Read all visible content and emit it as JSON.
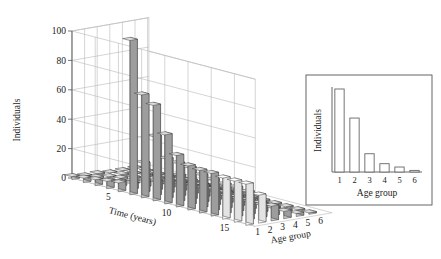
{
  "figure": {
    "main_chart": {
      "ylabel": "Individuals",
      "xlabel": "Time (years)",
      "zlabel": "Age group",
      "y_ticks": [
        "0",
        "20",
        "40",
        "60",
        "80",
        "100"
      ],
      "time_ticks": [
        "5",
        "10",
        "15"
      ],
      "age_ticks": [
        "6",
        "5",
        "4",
        "3",
        "2",
        "1"
      ]
    },
    "inset_chart": {
      "ylabel": "Individuals",
      "xlabel": "Age group",
      "x_ticks": [
        "1",
        "2",
        "3",
        "4",
        "5",
        "6"
      ]
    }
  },
  "chart_data": [
    {
      "type": "bar",
      "name": "main-3d-bar-chart",
      "title": "",
      "xlabel": "Time (years)",
      "ylabel": "Individuals",
      "zlabel": "Age group",
      "projection": "3d",
      "ylim": [
        0,
        105
      ],
      "grid": true,
      "x": [
        1,
        2,
        3,
        4,
        5,
        6,
        7,
        8,
        9,
        10,
        11,
        12,
        13,
        14,
        15,
        16
      ],
      "x_tick_labels": [
        "5",
        "10",
        "15"
      ],
      "x_tick_values": [
        5,
        10,
        15
      ],
      "categories": [
        "1",
        "2",
        "3",
        "4",
        "5",
        "6"
      ],
      "series": [
        {
          "name": "Age group 1",
          "values": [
            2,
            3,
            4,
            5,
            6,
            105,
            70,
            65,
            47,
            35,
            30,
            29,
            29,
            28,
            28,
            28
          ]
        },
        {
          "name": "Age group 2",
          "values": [
            1,
            2,
            2,
            3,
            4,
            20,
            40,
            27,
            26,
            25,
            22,
            21,
            20,
            20,
            19,
            19
          ]
        },
        {
          "name": "Age group 3",
          "values": [
            1,
            1,
            2,
            2,
            3,
            6,
            11,
            14,
            13,
            12,
            11,
            11,
            10,
            10,
            10,
            10
          ]
        },
        {
          "name": "Age group 4",
          "values": [
            0,
            1,
            1,
            1,
            2,
            3,
            5,
            6,
            6,
            6,
            5,
            5,
            5,
            5,
            5,
            5
          ]
        },
        {
          "name": "Age group 5",
          "values": [
            0,
            0,
            1,
            1,
            1,
            2,
            3,
            3,
            3,
            3,
            3,
            3,
            2,
            2,
            2,
            2
          ]
        },
        {
          "name": "Age group 6",
          "values": [
            0,
            0,
            0,
            1,
            1,
            1,
            1,
            2,
            2,
            2,
            1,
            1,
            1,
            1,
            1,
            1
          ]
        }
      ]
    },
    {
      "type": "bar",
      "name": "inset-bar-chart",
      "title": "",
      "xlabel": "Age group",
      "ylabel": "Individuals",
      "categories": [
        "1",
        "2",
        "3",
        "4",
        "5",
        "6"
      ],
      "values": [
        100,
        65,
        22,
        10,
        6,
        1
      ],
      "ylim": [
        0,
        105
      ],
      "grid": false
    }
  ]
}
